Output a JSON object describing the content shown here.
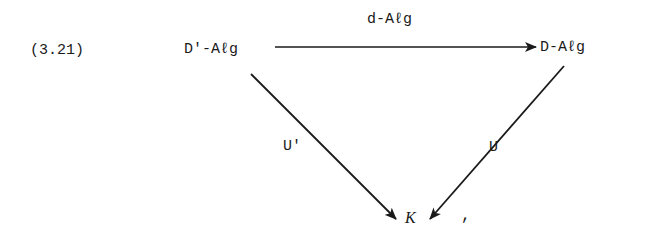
{
  "equation": {
    "number": "(3.21)",
    "nodes": {
      "top_left": "D'-Aℓg",
      "top_right": "D-Aℓg",
      "bottom": "K"
    },
    "arrows": {
      "top": {
        "label": "d-Aℓg",
        "from": "top_left",
        "to": "top_right"
      },
      "left": {
        "label": "U'",
        "from": "top_left",
        "to": "bottom"
      },
      "right": {
        "label": "U",
        "from": "top_right",
        "to": "bottom"
      }
    },
    "trailing_punctuation": ","
  },
  "colors": {
    "ink": "#1a1a1a",
    "background": "#ffffff"
  }
}
